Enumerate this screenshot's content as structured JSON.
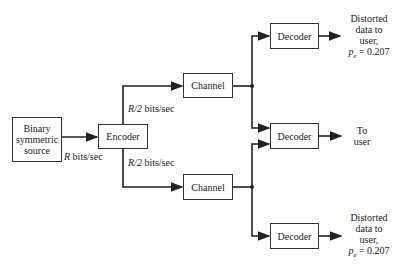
{
  "diagram": {
    "nodes": {
      "source": "Binary symmetric source",
      "source_lines": [
        "Binary",
        "symmetric",
        "source"
      ],
      "encoder": "Encoder",
      "channel_top": "Channel",
      "channel_bottom": "Channel",
      "decoder_top": "Decoder",
      "decoder_middle": "Decoder",
      "decoder_bottom": "Decoder"
    },
    "edge_labels": {
      "source_rate_var": "R",
      "source_rate_unit": "bits/sec",
      "branch_top_var": "R/2",
      "branch_top_unit": "bits/sec",
      "branch_bottom_var": "R/2",
      "branch_bottom_unit": "bits/sec"
    },
    "outputs": {
      "top": {
        "lines": [
          "Distorted",
          "data to",
          "user,"
        ],
        "pe_symbol": "p",
        "pe_sub": "e",
        "pe_value": "= 0.207"
      },
      "middle": {
        "lines": [
          "To",
          "user"
        ]
      },
      "bottom": {
        "lines": [
          "Distorted",
          "data to",
          "user,"
        ],
        "pe_symbol": "p",
        "pe_sub": "e",
        "pe_value": "= 0.207"
      }
    }
  }
}
